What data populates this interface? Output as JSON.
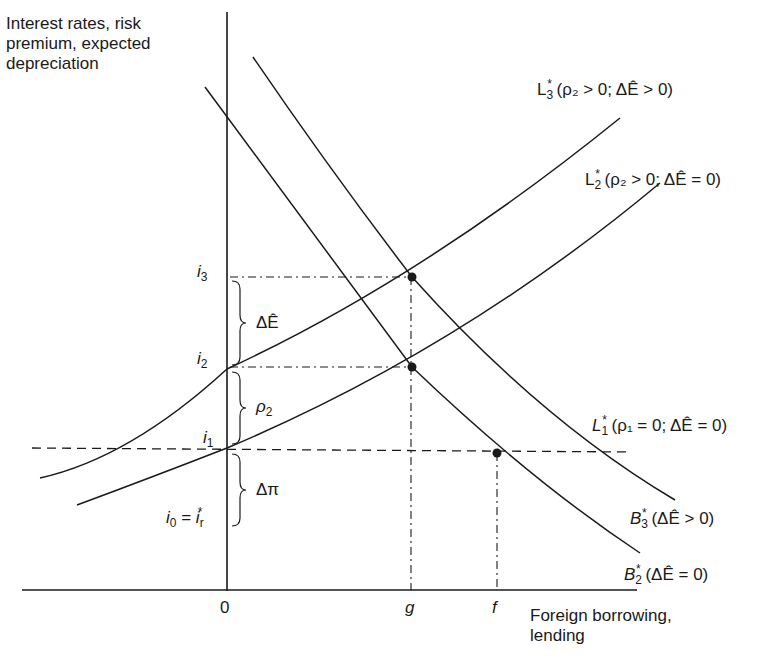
{
  "diagram": {
    "type": "economics-curve-diagram",
    "y_axis_title_lines": [
      "Interest rates, risk",
      "premium, expected",
      "depreciation"
    ],
    "x_axis_title_lines": [
      "Foreign borrowing,",
      "lending"
    ],
    "x_ticks": {
      "origin": "0",
      "g": "g",
      "f": "f"
    },
    "y_levels": {
      "i3": {
        "base": "i",
        "sub": "3"
      },
      "i2": {
        "base": "i",
        "sub": "2"
      },
      "i1": {
        "base": "i",
        "sub": "1"
      },
      "i0": {
        "base": "i",
        "sub": "0",
        "eq": " = ",
        "rhs": "i",
        "rhs_sub": "r",
        "rhs_sup": "*"
      }
    },
    "braces": {
      "delta_e_hat": "ΔÊ",
      "rho2": {
        "base": "ρ",
        "sub": "2"
      },
      "delta_pi": "Δπ"
    },
    "curves": [
      {
        "id": "L3",
        "name": "L",
        "sub": "3",
        "sup": "*",
        "condition": "(ρ₂ > 0; ΔÊ > 0)",
        "kind": "lending-supply"
      },
      {
        "id": "L2",
        "name": "L",
        "sub": "2",
        "sup": "*",
        "condition": "(ρ₂ > 0; ΔÊ = 0)",
        "kind": "lending-supply"
      },
      {
        "id": "L1",
        "name": "L",
        "sub": "1",
        "sup": "*",
        "condition": "(ρ₁ = 0; ΔÊ = 0)",
        "kind": "lending-supply-horizontal"
      },
      {
        "id": "B3",
        "name": "B",
        "sub": "3",
        "sup": "*",
        "condition": "(ΔÊ > 0)",
        "kind": "borrowing-demand"
      },
      {
        "id": "B2",
        "name": "B",
        "sub": "2",
        "sup": "*",
        "condition": "(ΔÊ = 0)",
        "kind": "borrowing-demand"
      }
    ],
    "equilibria": [
      {
        "label": "B3*∩L3* at (g, i3)"
      },
      {
        "label": "B2*∩L2* at (g, i2)"
      },
      {
        "label": "B2*∩L1* at (f, i1)"
      }
    ],
    "colors": {
      "ink": "#1a1a1a",
      "background": "#ffffff"
    }
  }
}
